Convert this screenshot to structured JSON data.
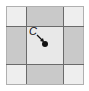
{
  "diagram": {
    "type": "3x3 grid",
    "cells": [
      {
        "row": 0,
        "col": 0,
        "shade": "corner"
      },
      {
        "row": 0,
        "col": 1,
        "shade": "edge"
      },
      {
        "row": 0,
        "col": 2,
        "shade": "corner"
      },
      {
        "row": 1,
        "col": 0,
        "shade": "edge"
      },
      {
        "row": 1,
        "col": 1,
        "shade": "center"
      },
      {
        "row": 1,
        "col": 2,
        "shade": "edge"
      },
      {
        "row": 2,
        "col": 0,
        "shade": "corner"
      },
      {
        "row": 2,
        "col": 1,
        "shade": "edge"
      },
      {
        "row": 2,
        "col": 2,
        "shade": "corner"
      }
    ],
    "colors": {
      "corner": "#eeeeee",
      "edge": "#c9c9c9",
      "center": "#e8e8e8",
      "lines": "#6a6a6a",
      "point": "#111111"
    },
    "point": {
      "label": "C",
      "description": "point at center of middle cell with arrow from label"
    }
  }
}
